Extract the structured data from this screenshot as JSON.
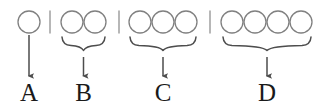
{
  "figure": {
    "background_color": "#ffffff",
    "circle_stroke_color": "#808080",
    "brace_color": "#4d4d4d",
    "arrow_color": "#4d4d4d",
    "separator_color": "#999999",
    "label_color": "#1a1a1a",
    "width": 325,
    "height": 106
  },
  "groups": [
    {
      "id": "group-a",
      "label": "A",
      "circle_count": 1,
      "has_brace": false,
      "circles": [
        {
          "cx": 29,
          "cy": 22,
          "r": 11
        }
      ],
      "arrow": {
        "x": 29,
        "y_start": 35,
        "y_end": 76
      },
      "label_position": {
        "x": 29,
        "y": 100
      }
    },
    {
      "id": "group-b",
      "label": "B",
      "circle_count": 2,
      "has_brace": true,
      "circles": [
        {
          "cx": 72,
          "cy": 22,
          "r": 11
        },
        {
          "cx": 95,
          "cy": 22,
          "r": 11
        }
      ],
      "brace": {
        "x_left": 62,
        "x_right": 105,
        "y_top": 36,
        "y_tip": 50,
        "x_tip": 83.5
      },
      "arrow": {
        "x": 83.5,
        "y_start": 57,
        "y_end": 76
      },
      "label_position": {
        "x": 83.5,
        "y": 100
      }
    },
    {
      "id": "group-c",
      "label": "C",
      "circle_count": 3,
      "has_brace": true,
      "circles": [
        {
          "cx": 140,
          "cy": 22,
          "r": 11
        },
        {
          "cx": 163,
          "cy": 22,
          "r": 11
        },
        {
          "cx": 186,
          "cy": 22,
          "r": 11
        }
      ],
      "brace": {
        "x_left": 130,
        "x_right": 196,
        "y_top": 36,
        "y_tip": 50,
        "x_tip": 163
      },
      "arrow": {
        "x": 163,
        "y_start": 57,
        "y_end": 76
      },
      "label_position": {
        "x": 163,
        "y": 100
      }
    },
    {
      "id": "group-d",
      "label": "D",
      "circle_count": 4,
      "has_brace": true,
      "circles": [
        {
          "cx": 232,
          "cy": 22,
          "r": 11
        },
        {
          "cx": 255,
          "cy": 22,
          "r": 11
        },
        {
          "cx": 278,
          "cy": 22,
          "r": 11
        },
        {
          "cx": 301,
          "cy": 22,
          "r": 11
        }
      ],
      "brace": {
        "x_left": 223,
        "x_right": 311,
        "y_top": 36,
        "y_tip": 50,
        "x_tip": 267
      },
      "arrow": {
        "x": 267,
        "y_start": 57,
        "y_end": 76
      },
      "label_position": {
        "x": 267,
        "y": 100
      }
    }
  ],
  "separators": [
    {
      "id": "separator-1",
      "x": 50,
      "y_top": 11,
      "y_bottom": 33
    },
    {
      "id": "separator-2",
      "x": 119,
      "y_top": 11,
      "y_bottom": 33
    },
    {
      "id": "separator-3",
      "x": 210,
      "y_top": 11,
      "y_bottom": 33
    }
  ]
}
